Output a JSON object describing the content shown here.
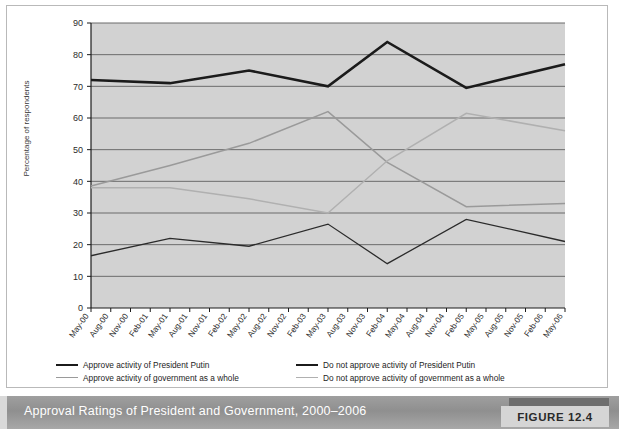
{
  "figure": {
    "caption": "Approval Ratings of President and Government, 2000–2006",
    "badge_label": "FIGURE 12.4"
  },
  "colors": {
    "plot_background": "#d2d2d2",
    "gridline": "#6b6b6b",
    "axis": "#1b1b1b",
    "approve_putin": "#1b1b1b",
    "not_approve_putin": "#2b2b2b",
    "approve_gov": "#9a9a9a",
    "not_approve_gov": "#b0b0b0",
    "caption_bar": "#989898",
    "badge_bg": "#d5d5d5"
  },
  "legend": {
    "items": [
      {
        "label": "Approve  activity of President Putin",
        "style": "thick-dark"
      },
      {
        "label": "Do not approve activity of President Putin",
        "style": "thin-dark"
      },
      {
        "label": "Approve  activity of government as a whole",
        "style": "gray-light"
      },
      {
        "label": "Do not approve activity of government as a whole",
        "style": "gray-dark"
      }
    ]
  },
  "chart_data": {
    "type": "line",
    "title": "Approval Ratings of President and Government, 2000–2006",
    "xlabel": "",
    "ylabel": "Percentage of respondents",
    "ylim": [
      0,
      90
    ],
    "yticks": [
      0,
      10,
      20,
      30,
      40,
      50,
      60,
      70,
      80,
      90
    ],
    "grid": true,
    "legend_position": "bottom",
    "categories": [
      "May-00",
      "Aug-00",
      "Nov-00",
      "Feb-01",
      "May-01",
      "Aug-01",
      "Nov-01",
      "Feb-02",
      "May-02",
      "Aug-02",
      "Nov-02",
      "Feb-03",
      "May-03",
      "Aug-03",
      "Nov-03",
      "Feb-04",
      "May-04",
      "Aug-04",
      "Nov-04",
      "Feb-05",
      "May-05",
      "Aug-05",
      "Nov-05",
      "Feb-06",
      "May-06"
    ],
    "series": [
      {
        "name": "Approve  activity of President Putin",
        "color": "#1b1b1b",
        "width": 2.6,
        "points": [
          {
            "x": "May-00",
            "y": 72
          },
          {
            "x": "May-01",
            "y": 71
          },
          {
            "x": "May-02",
            "y": 75
          },
          {
            "x": "May-03",
            "y": 70
          },
          {
            "x": "Feb-04",
            "y": 84
          },
          {
            "x": "Feb-05",
            "y": 69.5
          },
          {
            "x": "May-06",
            "y": 77
          }
        ]
      },
      {
        "name": "Do not approve activity of President Putin",
        "color": "#2b2b2b",
        "width": 1.3,
        "points": [
          {
            "x": "May-00",
            "y": 16.5
          },
          {
            "x": "May-01",
            "y": 22
          },
          {
            "x": "May-02",
            "y": 19.5
          },
          {
            "x": "May-03",
            "y": 26.5
          },
          {
            "x": "Feb-04",
            "y": 14
          },
          {
            "x": "Feb-05",
            "y": 28
          },
          {
            "x": "May-06",
            "y": 21
          }
        ]
      },
      {
        "name": "Approve  activity of government as a whole",
        "color": "#9a9a9a",
        "width": 1.5,
        "points": [
          {
            "x": "May-00",
            "y": 38.5
          },
          {
            "x": "May-01",
            "y": 45
          },
          {
            "x": "May-02",
            "y": 52
          },
          {
            "x": "May-03",
            "y": 62
          },
          {
            "x": "Feb-04",
            "y": 46
          },
          {
            "x": "Feb-05",
            "y": 32
          },
          {
            "x": "May-06",
            "y": 33
          }
        ]
      },
      {
        "name": "Do not approve activity of government as a whole",
        "color": "#b0b0b0",
        "width": 1.5,
        "points": [
          {
            "x": "May-00",
            "y": 38
          },
          {
            "x": "May-01",
            "y": 38
          },
          {
            "x": "May-02",
            "y": 34.5
          },
          {
            "x": "May-03",
            "y": 30
          },
          {
            "x": "Feb-04",
            "y": 46.5
          },
          {
            "x": "Feb-05",
            "y": 61.5
          },
          {
            "x": "May-06",
            "y": 56
          }
        ]
      }
    ]
  }
}
